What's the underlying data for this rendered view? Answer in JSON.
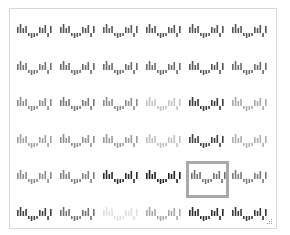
{
  "palette": {
    "title": "Sparkline style gallery",
    "rows": 6,
    "columns": 6,
    "selected": {
      "row": 5,
      "column": 5
    },
    "sparkline_values": [
      6,
      9,
      5,
      7,
      -3,
      -5,
      -4,
      -3,
      6,
      5,
      8,
      -4,
      7
    ],
    "cells": [
      [
        {
          "color": "#545454"
        },
        {
          "color": "#545454"
        },
        {
          "color": "#5a5a5a"
        },
        {
          "color": "#545454"
        },
        {
          "color": "#545454"
        },
        {
          "color": "#545454"
        }
      ],
      [
        {
          "color": "#707070"
        },
        {
          "color": "#6a6a6a"
        },
        {
          "color": "#6a6a6a"
        },
        {
          "color": "#6a6a6a"
        },
        {
          "color": "#555555"
        },
        {
          "color": "#6a6a6a"
        }
      ],
      [
        {
          "color": "#8a8a8a"
        },
        {
          "color": "#777777"
        },
        {
          "color": "#8a8a8a"
        },
        {
          "color": "#c4c4c4"
        },
        {
          "color": "#3a3a3a"
        },
        {
          "color": "#a8a8a8"
        }
      ],
      [
        {
          "color": "#a0a0a0"
        },
        {
          "color": "#909090"
        },
        {
          "color": "#9a9a9a"
        },
        {
          "color": "#c0c0c0"
        },
        {
          "color": "#404040"
        },
        {
          "color": "#b0b0b0"
        }
      ],
      [
        {
          "color": "#8a8a8a"
        },
        {
          "color": "#808080"
        },
        {
          "color": "#2c2c2c"
        },
        {
          "color": "#1e1e1e"
        },
        {
          "color": "#707070"
        },
        {
          "color": "#7a7a7a"
        }
      ],
      [
        {
          "color": "#404040"
        },
        {
          "color": "#707070"
        },
        {
          "color": "#e0e0e0"
        },
        {
          "color": "#a8a8a8"
        },
        {
          "color": "#2a2a2a"
        },
        {
          "color": "#3a3a3a"
        }
      ]
    ],
    "selection_border_color": "#a9a9a9",
    "panel_border_color": "#d8d8d8"
  }
}
